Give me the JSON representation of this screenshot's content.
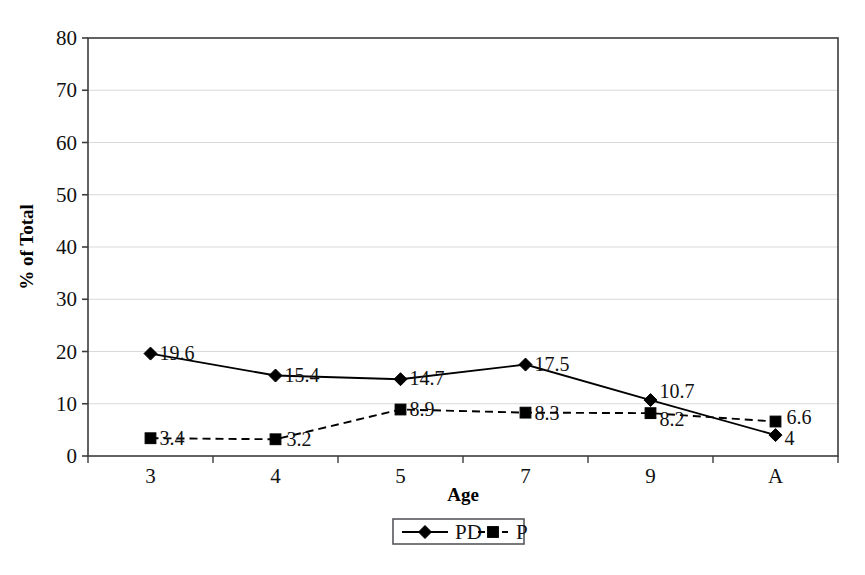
{
  "chart_data": {
    "type": "line",
    "title": "",
    "xlabel": "Age",
    "ylabel": "% of Total",
    "categories": [
      "3",
      "4",
      "5",
      "7",
      "9",
      "A"
    ],
    "ylim": [
      0,
      80
    ],
    "ytick_step": 10,
    "yticks": [
      "0",
      "10",
      "20",
      "30",
      "40",
      "50",
      "60",
      "70",
      "80"
    ],
    "grid": "horizontal",
    "legend_position": "bottom-center",
    "series": [
      {
        "name": "PD",
        "values": [
          19.6,
          15.4,
          14.7,
          17.5,
          10.7,
          4
        ],
        "labels": [
          "19.6",
          "15.4",
          "14.7",
          "17.5",
          "10.7",
          "4"
        ],
        "line_style": "solid",
        "marker": "diamond",
        "color": "#000000"
      },
      {
        "name": "P",
        "values": [
          3.4,
          3.2,
          8.9,
          8.3,
          8.2,
          6.6
        ],
        "labels": [
          "3.4",
          "3.2",
          "8.9",
          "8.3",
          "8.2",
          "6.6"
        ],
        "line_style": "dashed",
        "marker": "square",
        "color": "#000000"
      }
    ]
  },
  "legend": {
    "items": [
      {
        "label": "PD",
        "marker": "diamond-marker",
        "line_style": "solid"
      },
      {
        "label": "P",
        "marker": "square-marker",
        "line_style": "dashed"
      }
    ]
  },
  "colors": {
    "background": "#ffffff",
    "axis": "#3c3c3c",
    "gridline": "#d9d9d9",
    "series": "#000000",
    "text": "#111111"
  }
}
